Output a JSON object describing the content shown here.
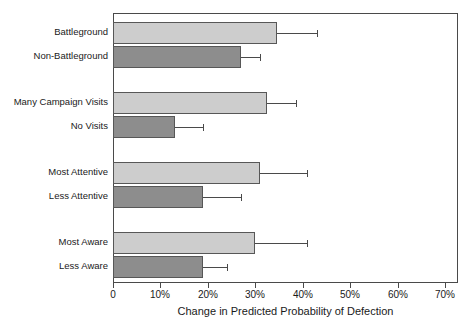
{
  "chart_data": {
    "type": "bar",
    "orientation": "horizontal",
    "title": "",
    "xlabel": "Change in Predicted Probability of Defection",
    "ylabel": "",
    "xlim": [
      0,
      70
    ],
    "xtick_labels": [
      "0",
      "10%",
      "20%",
      "30%",
      "40%",
      "50%",
      "60%",
      "70%"
    ],
    "xtick_values": [
      0,
      10,
      20,
      30,
      40,
      50,
      60,
      70
    ],
    "grid": false,
    "legend": "none",
    "units": "percent",
    "colors": {
      "light_bar": "#cdcdcd",
      "dark_bar": "#8d8d8d",
      "bar_edge": "#575757",
      "axis": "#4a4a4a",
      "text": "#1a1a1a",
      "background": "#ffffff"
    },
    "groups": [
      {
        "name": "Battleground status",
        "bars": [
          {
            "label": "Battleground",
            "value": 34.5,
            "error_high": 43.0,
            "shade": "light"
          },
          {
            "label": "Non-Battleground",
            "value": 27.0,
            "error_high": 31.0,
            "shade": "dark"
          }
        ]
      },
      {
        "name": "Campaign visits",
        "bars": [
          {
            "label": "Many Campaign Visits",
            "value": 32.5,
            "error_high": 38.5,
            "shade": "light"
          },
          {
            "label": "No Visits",
            "value": 13.0,
            "error_high": 19.0,
            "shade": "dark"
          }
        ]
      },
      {
        "name": "Attentiveness",
        "bars": [
          {
            "label": "Most Attentive",
            "value": 31.0,
            "error_high": 41.0,
            "shade": "light"
          },
          {
            "label": "Less Attentive",
            "value": 19.0,
            "error_high": 27.0,
            "shade": "dark"
          }
        ]
      },
      {
        "name": "Awareness",
        "bars": [
          {
            "label": "Most Aware",
            "value": 30.0,
            "error_high": 41.0,
            "shade": "light"
          },
          {
            "label": "Less Aware",
            "value": 19.0,
            "error_high": 24.0,
            "shade": "dark"
          }
        ]
      }
    ]
  }
}
